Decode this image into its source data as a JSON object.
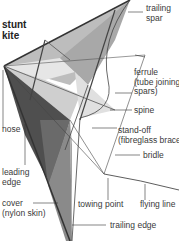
{
  "title": "stunt\nkite",
  "labels": {
    "trailing_spar": "trailing\nspar",
    "ferrule": "ferrule\n(tube joining\nspars)",
    "spine": "spine",
    "nose": "nose",
    "stand_off": "stand-off\n(fibreglass brace)",
    "bridle": "bridle",
    "leading_edge": "leading\nedge",
    "cover": "cover\n(nylon skin)",
    "towing_point": "towing point",
    "flying_line": "flying line",
    "trailing_edge": "trailing edge"
  },
  "colors": {
    "sail_light": "#d9d9d9",
    "sail_mid": "#b3b3b3",
    "sail_dark": "#6e6e6e",
    "sail_darkest": "#4a4a4a",
    "line": "#333333"
  }
}
